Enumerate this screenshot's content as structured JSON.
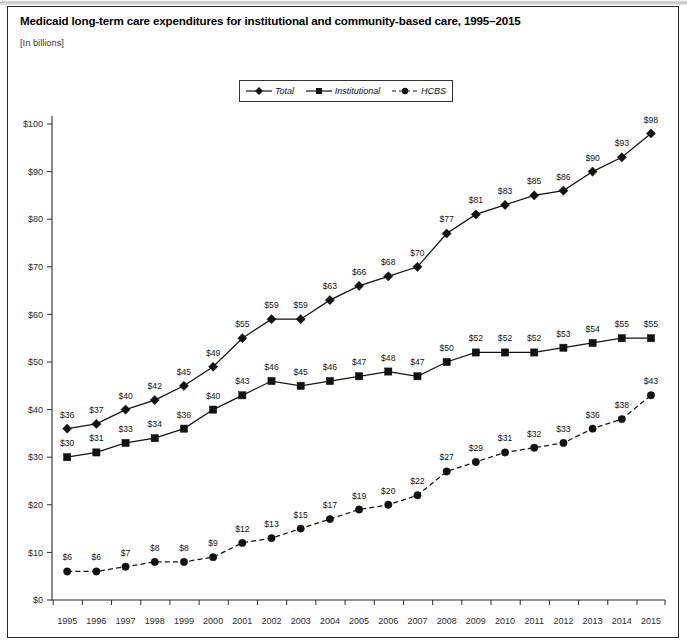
{
  "figure": {
    "title": "Medicaid long-term care expenditures for institutional and community-based care, 1995–2015",
    "subtitle": "[In billions]"
  },
  "legend": {
    "position": "top-center",
    "items": [
      {
        "label": "Total",
        "marker": "diamond",
        "line": "solid"
      },
      {
        "label": "Institutional",
        "marker": "square",
        "line": "solid"
      },
      {
        "label": "HCBS",
        "marker": "circle",
        "line": "dashed"
      }
    ]
  },
  "axes": {
    "y_ticks": [
      "$0",
      "$10",
      "$20",
      "$30",
      "$40",
      "$50",
      "$60",
      "$70",
      "$80",
      "$90",
      "$100"
    ],
    "x_ticks": [
      "1995",
      "1996",
      "1997",
      "1998",
      "1999",
      "2000",
      "2001",
      "2002",
      "2003",
      "2004",
      "2005",
      "2006",
      "2007",
      "2008",
      "2009",
      "2010",
      "2011",
      "2012",
      "2013",
      "2014",
      "2015"
    ]
  },
  "chart_data": {
    "type": "line",
    "title": "Medicaid long-term care expenditures for institutional and community-based care, 1995–2015",
    "subtitle": "[In billions]",
    "xlabel": "",
    "ylabel": "[In billions]",
    "ylim": [
      0,
      100
    ],
    "ytick_step": 10,
    "grid": false,
    "legend_position": "top-center",
    "x": [
      1995,
      1996,
      1997,
      1998,
      1999,
      2000,
      2001,
      2002,
      2003,
      2004,
      2005,
      2006,
      2007,
      2008,
      2009,
      2010,
      2011,
      2012,
      2013,
      2014,
      2015
    ],
    "categories": [
      "1995",
      "1996",
      "1997",
      "1998",
      "1999",
      "2000",
      "2001",
      "2002",
      "2003",
      "2004",
      "2005",
      "2006",
      "2007",
      "2008",
      "2009",
      "2010",
      "2011",
      "2012",
      "2013",
      "2014",
      "2015"
    ],
    "series": [
      {
        "name": "Total",
        "marker": "diamond",
        "line": "solid",
        "values": [
          36,
          37,
          40,
          42,
          45,
          49,
          55,
          59,
          59,
          63,
          66,
          68,
          70,
          77,
          81,
          83,
          85,
          86,
          90,
          93,
          98
        ],
        "labels": [
          "$36",
          "$37",
          "$40",
          "$42",
          "$45",
          "$49",
          "$55",
          "$59",
          "$59",
          "$63",
          "$66",
          "$68",
          "$70",
          "$77",
          "$81",
          "$83",
          "$85",
          "$86",
          "$90",
          "$93",
          "$98"
        ]
      },
      {
        "name": "Institutional",
        "marker": "square",
        "line": "solid",
        "values": [
          30,
          31,
          33,
          34,
          36,
          40,
          43,
          46,
          45,
          46,
          47,
          48,
          47,
          50,
          52,
          52,
          52,
          53,
          54,
          55,
          55
        ],
        "labels": [
          "$30",
          "$31",
          "$33",
          "$34",
          "$36",
          "$40",
          "$43",
          "$46",
          "$45",
          "$46",
          "$47",
          "$48",
          "$47",
          "$50",
          "$52",
          "$52",
          "$52",
          "$53",
          "$54",
          "$55",
          "$55"
        ]
      },
      {
        "name": "HCBS",
        "marker": "circle",
        "line": "dashed",
        "values": [
          6,
          6,
          7,
          8,
          8,
          9,
          12,
          13,
          15,
          17,
          19,
          20,
          22,
          27,
          29,
          31,
          32,
          33,
          36,
          38,
          43
        ],
        "labels": [
          "$6",
          "$6",
          "$7",
          "$8",
          "$8",
          "$9",
          "$12",
          "$13",
          "$15",
          "$17",
          "$19",
          "$20",
          "$22",
          "$27",
          "$29",
          "$31",
          "$32",
          "$33",
          "$36",
          "$38",
          "$43"
        ]
      }
    ]
  }
}
